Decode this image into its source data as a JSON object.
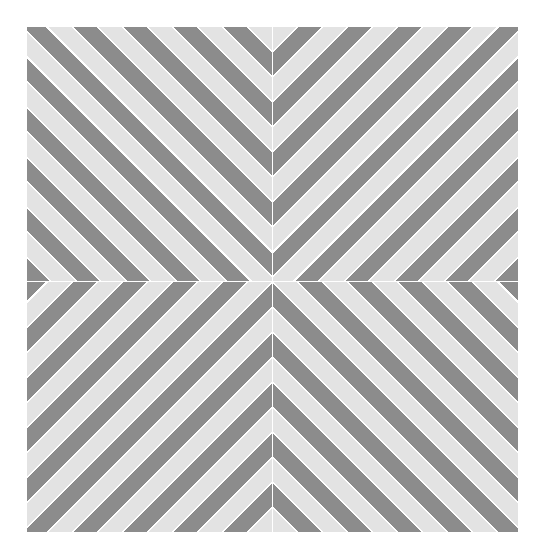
{
  "artwork": {
    "layout": "2x2 quadrants of diagonal stripes converging at center",
    "colors": {
      "dark_stripe": "#8c8c8c",
      "light_stripe": "#e3e3e3",
      "separator": "#ffffff",
      "background": "#ffffff"
    },
    "quadrants": [
      {
        "position": "top-left",
        "orientation": "45deg"
      },
      {
        "position": "top-right",
        "orientation": "-45deg"
      },
      {
        "position": "bottom-left",
        "orientation": "-45deg"
      },
      {
        "position": "bottom-right",
        "orientation": "45deg"
      }
    ]
  }
}
